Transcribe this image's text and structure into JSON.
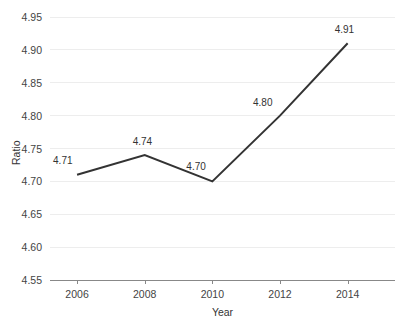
{
  "chart_data": {
    "type": "line",
    "title": "",
    "subtitle": "",
    "xlabel": "Year",
    "ylabel": "Ratio",
    "x": [
      2006,
      2008,
      2010,
      2012,
      2014
    ],
    "categories": [
      "2006",
      "2008",
      "2010",
      "2012",
      "2014"
    ],
    "values": [
      4.71,
      4.74,
      4.7,
      4.8,
      4.91
    ],
    "point_labels": [
      "4.71",
      "4.74",
      "4.70",
      "4.80",
      "4.91"
    ],
    "series": [
      {
        "name": "Ratio",
        "values": [
          4.71,
          4.74,
          4.7,
          4.8,
          4.91
        ]
      }
    ],
    "ylim": [
      4.55,
      4.95
    ],
    "xlim": [
      2005.2,
      2015.4
    ],
    "ytick_labels": [
      "4.95",
      "4.90",
      "4.85",
      "4.80",
      "4.75",
      "4.70",
      "4.65",
      "4.60",
      "4.55"
    ],
    "ytick_values": [
      4.95,
      4.9,
      4.85,
      4.8,
      4.75,
      4.7,
      4.65,
      4.6,
      4.55
    ],
    "xtick_labels": [
      "2006",
      "2008",
      "2010",
      "2012",
      "2014"
    ],
    "xtick_values": [
      2006,
      2008,
      2010,
      2012,
      2014
    ],
    "grid": "horizontal",
    "legend": "none",
    "colors": {
      "line": "#333333",
      "gridline": "#ededed",
      "axis": "#888888",
      "text": "#444444",
      "background": "#ffffff"
    }
  }
}
